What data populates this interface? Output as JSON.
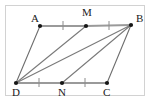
{
  "figure": {
    "kind": "geometry-diagram",
    "frame": {
      "visible": true,
      "border_color": "#d2d2d2",
      "background_color": "#ffffff"
    },
    "style": {
      "line_color": "#6e6e6e",
      "side_color": "#9a9a9a",
      "tick_color": "#8c8c8c",
      "dot_color": "#161616",
      "label_color": "#1a1a1a"
    },
    "points": [
      {
        "id": "A",
        "label": "A",
        "x": 40,
        "y": 26,
        "label_x": 31,
        "label_y": 22,
        "dot": true
      },
      {
        "id": "M",
        "label": "M",
        "x": 86,
        "y": 26,
        "label_x": 82,
        "label_y": 16,
        "dot": true
      },
      {
        "id": "B",
        "label": "B",
        "x": 131,
        "y": 25,
        "label_x": 136,
        "label_y": 22,
        "dot": true
      },
      {
        "id": "D",
        "label": "D",
        "x": 16,
        "y": 83,
        "label_x": 12,
        "label_y": 96,
        "dot": true
      },
      {
        "id": "N",
        "label": "N",
        "x": 62,
        "y": 83,
        "label_x": 58,
        "label_y": 96,
        "dot": true
      },
      {
        "id": "C",
        "label": "C",
        "x": 107,
        "y": 83,
        "label_x": 103,
        "label_y": 96,
        "dot": true
      }
    ],
    "segments": [
      {
        "id": "AM",
        "from": "A",
        "to": "M",
        "role": "side",
        "weight": "thick"
      },
      {
        "id": "MB",
        "from": "M",
        "to": "B",
        "role": "side",
        "weight": "thick"
      },
      {
        "id": "DN",
        "from": "D",
        "to": "N",
        "role": "side",
        "weight": "thick"
      },
      {
        "id": "NC",
        "from": "N",
        "to": "C",
        "role": "side",
        "weight": "thick"
      },
      {
        "id": "AD",
        "from": "A",
        "to": "D",
        "role": "side",
        "weight": "thin"
      },
      {
        "id": "BC",
        "from": "B",
        "to": "C",
        "role": "side",
        "weight": "thin"
      },
      {
        "id": "DM",
        "from": "D",
        "to": "M",
        "role": "cevian",
        "weight": "thin"
      },
      {
        "id": "DB",
        "from": "D",
        "to": "B",
        "role": "cevian",
        "weight": "thin"
      },
      {
        "id": "BN",
        "from": "B",
        "to": "N",
        "role": "cevian",
        "weight": "thin"
      }
    ],
    "ticks": [
      {
        "id": "tick-AM",
        "on": "AM",
        "x": 63,
        "y": 26,
        "marks": 1
      },
      {
        "id": "tick-MB",
        "on": "MB",
        "x": 109,
        "y": 26,
        "marks": 1
      },
      {
        "id": "tick-DN",
        "on": "DN",
        "x": 39,
        "y": 83,
        "marks": 1
      },
      {
        "id": "tick-NC",
        "on": "NC",
        "x": 85,
        "y": 83,
        "marks": 1
      }
    ]
  }
}
